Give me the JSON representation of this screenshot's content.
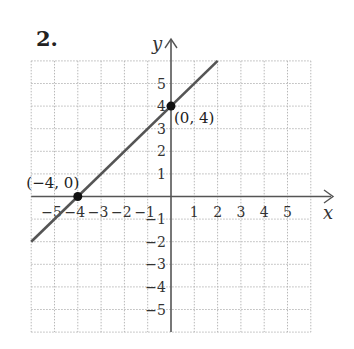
{
  "problem_number": "2.",
  "chart_data": {
    "type": "line",
    "title": "",
    "xlabel": "x",
    "ylabel": "y",
    "xlim": [
      -6,
      6
    ],
    "ylim": [
      -6,
      6
    ],
    "grid": true,
    "x_ticks": [
      -5,
      -4,
      -3,
      -2,
      -1,
      1,
      2,
      3,
      4,
      5
    ],
    "y_ticks": [
      5,
      4,
      3,
      2,
      1,
      -1,
      -2,
      -3,
      -4,
      -5
    ],
    "x_tick_labels": [
      "−5",
      "−4",
      "−3",
      "−2",
      "−1",
      "1",
      "2",
      "3",
      "4",
      "5"
    ],
    "y_tick_labels": [
      "5",
      "4",
      "3",
      "2",
      "1",
      "−1",
      "−2",
      "−3",
      "−4",
      "−5"
    ],
    "series": [
      {
        "name": "line",
        "equation": "y = x + 4",
        "x": [
          -6,
          2
        ],
        "y": [
          -2,
          6
        ]
      }
    ],
    "points": [
      {
        "x": -4,
        "y": 0,
        "label": "(−4, 0)"
      },
      {
        "x": 0,
        "y": 4,
        "label": "(0, 4)"
      }
    ],
    "colors": {
      "grid": "#b8b8b8",
      "axis": "#555555",
      "line": "#555555",
      "point": "#111111"
    }
  }
}
